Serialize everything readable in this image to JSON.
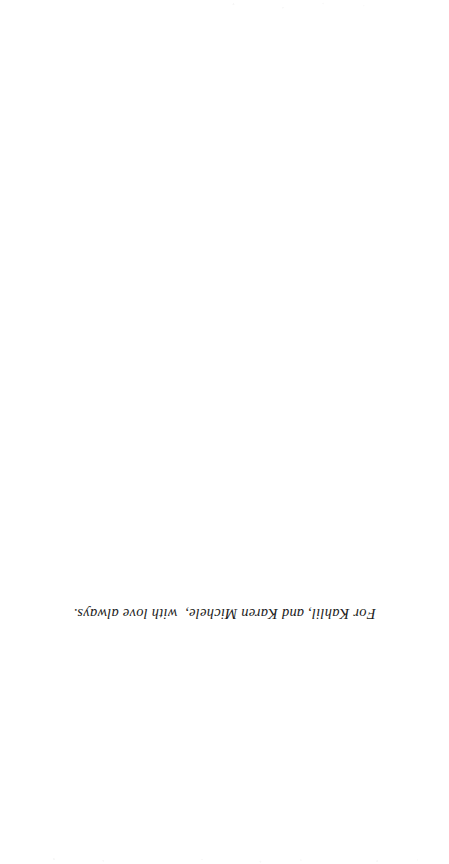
{
  "page": {
    "kind": "book-dedication-page",
    "background_color": "#ffffff",
    "text_color": "#1b1b1b",
    "orientation_note": "upside-down",
    "rotation_degrees": 180
  },
  "dedication": {
    "text": "For Kahlil, and Karen Michele,  with love always."
  }
}
